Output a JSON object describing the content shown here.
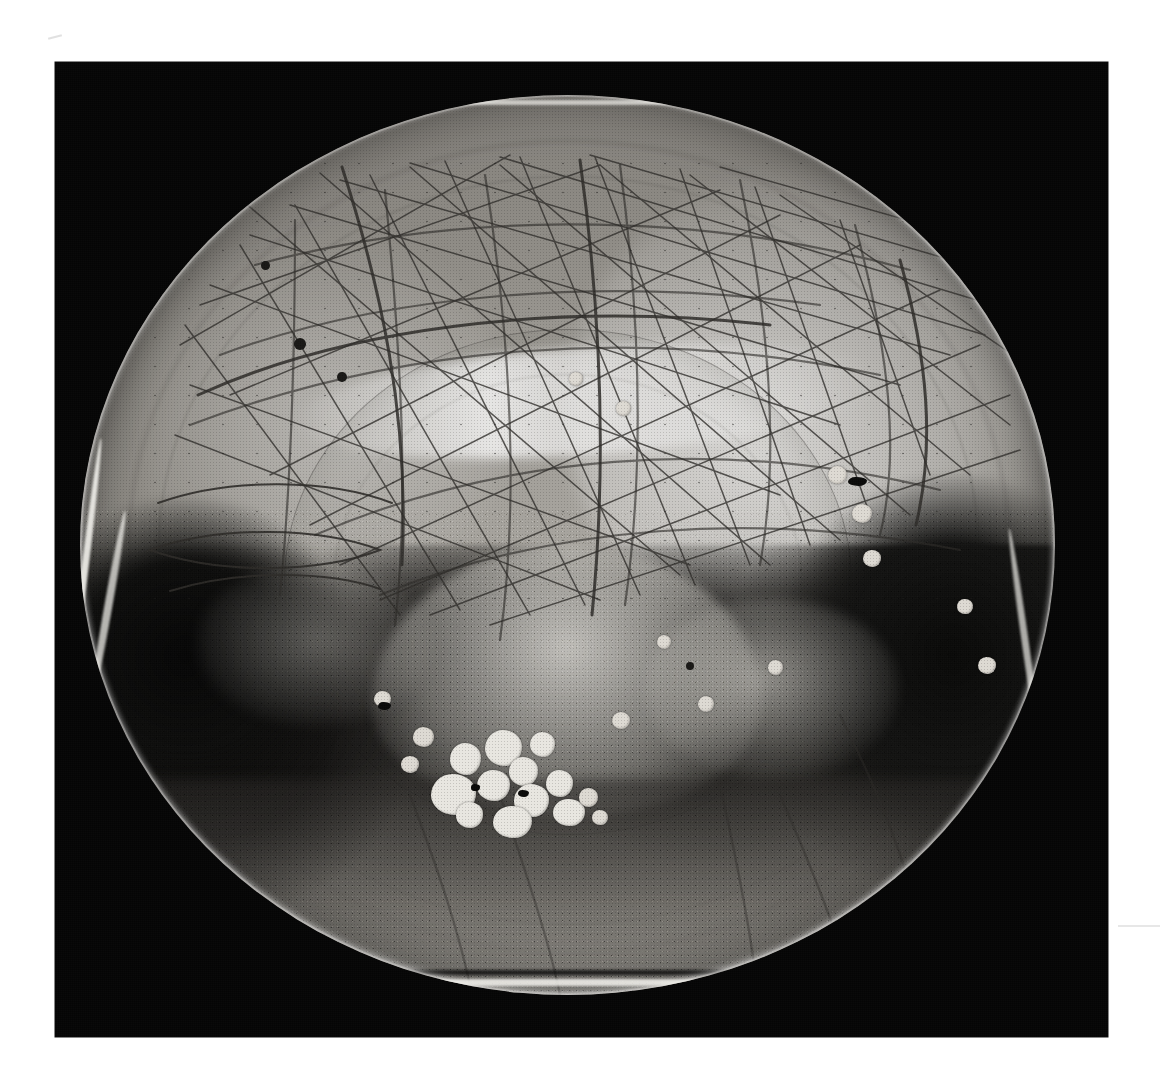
{
  "document": {
    "kind": "archival-black-and-white-photograph",
    "subject": "ceramic bowl interior, viewed from directly above",
    "alt_text": "Black and white photograph of the interior of a shallow circular ceramic bowl. The upper half shows a pale, crazed glaze covered by a dense network of fine scratches. The lower half is covered by dark, granular pooled glaze with scalloped edges, and a cluster of bright white rounded inclusions sits left of centre. Bright specular highlights outline the left, right and lower rim.",
    "background_color": "#ffffff",
    "plate_color": "#050505"
  },
  "plate": {
    "label": "photographic-plate",
    "left": 55,
    "top": 62,
    "width": 1053,
    "height": 975
  },
  "bowl": {
    "label": "ceramic-bowl",
    "center_x": 567,
    "center_y": 545,
    "diameter_px": 975,
    "rim_highlight_color": "#efeee9",
    "light_glaze_color": "#b3b0aa",
    "dark_glaze_color": "#141312",
    "inclusion_color": "#e8e6e0"
  },
  "regions": [
    {
      "id": "upper-glaze",
      "name": "pale crazed glaze field",
      "description": "light grey glaze with dense criss-crossing scratch network"
    },
    {
      "id": "central-well",
      "name": "central well ring",
      "description": "faint concentric throwing ring marking the bowl well"
    },
    {
      "id": "dark-pool",
      "name": "dark pooled granular glaze",
      "description": "black speckled glaze pooling across the lower half with scalloped upper edges"
    },
    {
      "id": "blob-cluster",
      "name": "white inclusion cluster",
      "description": "cluster of bright rounded inclusions below and left of centre"
    },
    {
      "id": "rim",
      "name": "bowl rim",
      "description": "thin bright specular rim highlight around the vessel edge"
    }
  ],
  "margin_marks": [
    {
      "id": "smudge-top-left",
      "name": "faint pencil smudge"
    },
    {
      "id": "smudge-right",
      "name": "faint horizontal smudge"
    }
  ]
}
